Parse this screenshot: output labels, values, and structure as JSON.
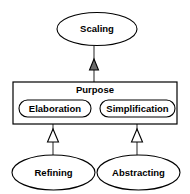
{
  "diagram": {
    "type": "uml-generalization",
    "colors": {
      "background": "#ffffff",
      "stroke": "#000000",
      "edge": "#555555",
      "arrow_fill_hollow": "#ffffff",
      "arrow_fill_solid": "#6b6b6b"
    },
    "nodes": {
      "scaling": {
        "label": "Scaling",
        "shape": "ellipse",
        "x": 97,
        "y": 29,
        "rx": 40,
        "ry": 16.5
      },
      "purpose": {
        "label": "Purpose",
        "shape": "rectangle",
        "x": 13,
        "y": 82,
        "width": 164,
        "height": 42
      },
      "elaboration": {
        "label": "Elaboration",
        "shape": "rounded-rectangle",
        "x": 19,
        "y": 100,
        "width": 72,
        "height": 17
      },
      "simplification": {
        "label": "Simplification",
        "shape": "rounded-rectangle",
        "x": 100,
        "y": 100,
        "width": 75,
        "height": 17
      },
      "refining": {
        "label": "Refining",
        "shape": "ellipse",
        "x": 53.5,
        "y": 172.5,
        "rx": 41.5,
        "ry": 17.5
      },
      "abstracting": {
        "label": "Abstracting",
        "shape": "ellipse",
        "x": 138.5,
        "y": 172.5,
        "rx": 41.5,
        "ry": 17.5
      }
    },
    "edges": [
      {
        "id": "purpose-to-scaling",
        "from": "purpose",
        "to": "scaling",
        "relation": "generalization",
        "arrow": "triangle-solid"
      },
      {
        "id": "refining-to-elaboration",
        "from": "refining",
        "to": "elaboration",
        "relation": "generalization",
        "arrow": "triangle-hollow"
      },
      {
        "id": "abstracting-to-simplification",
        "from": "abstracting",
        "to": "simplification",
        "relation": "generalization",
        "arrow": "triangle-hollow"
      }
    ]
  }
}
